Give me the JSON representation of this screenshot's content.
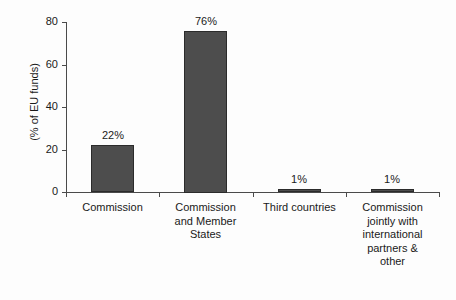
{
  "chart_data": {
    "type": "bar",
    "title": "",
    "subtitle": "",
    "xlabel": "",
    "ylabel": "(% of EU funds)",
    "ylim": [
      0,
      80
    ],
    "yticks": [
      0,
      20,
      40,
      60,
      80
    ],
    "ytick_labels": [
      "0",
      "20",
      "40",
      "60",
      "80"
    ],
    "grid": false,
    "legend": false,
    "legend_position": "none",
    "bar_color": "#4d4d4d",
    "bar_edge_color": "#2b2b2b",
    "axis_color": "#4a4a4a",
    "background_color": "#fdfdfd",
    "categories": [
      "Commission",
      "Commission and Member States",
      "Third countries",
      "Commission jointly with international partners & other"
    ],
    "category_lines": [
      [
        "Commission"
      ],
      [
        "Commission",
        "and Member",
        "States"
      ],
      [
        "Third countries"
      ],
      [
        "Commission",
        "jointly with",
        "international",
        "partners &",
        "other"
      ]
    ],
    "values": [
      22,
      76,
      1,
      1
    ],
    "value_labels": [
      "22%",
      "76%",
      "1%",
      "1%"
    ]
  }
}
